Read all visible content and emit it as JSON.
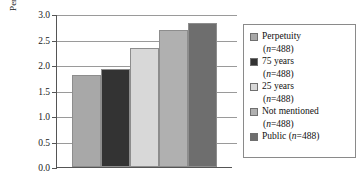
{
  "chart_data": {
    "type": "bar",
    "title": "",
    "xlabel": "",
    "ylabel": "Percent refused",
    "ylim": [
      0.0,
      3.0
    ],
    "ytick_labels": [
      "3.0",
      "2.5",
      "2.0",
      "1.5",
      "1.0",
      "0.5",
      "0.0"
    ],
    "ytick_values": [
      3.0,
      2.5,
      2.0,
      1.5,
      1.0,
      0.5,
      0.0
    ],
    "grid": true,
    "legend_position": "right",
    "categories": [
      "Perpetuity",
      "75 years",
      "25 years",
      "Not mentioned",
      "Public"
    ],
    "values": [
      1.8,
      1.92,
      2.33,
      2.68,
      2.82
    ],
    "n_per_category": [
      488,
      488,
      488,
      488,
      488
    ],
    "bar_colors": [
      "#a8a8a8",
      "#333333",
      "#d8d8d8",
      "#b0b0b0",
      "#6e6e6e"
    ],
    "series": [
      {
        "name": "Percent refused",
        "values": [
          1.8,
          1.92,
          2.33,
          2.68,
          2.82
        ]
      }
    ]
  },
  "legend": {
    "entries": [
      {
        "label": "Perpetuity",
        "sub": "(n=488)",
        "n_prefix": "n",
        "n_value": "=488",
        "color": "#a8a8a8"
      },
      {
        "label": "75 years",
        "sub": "(n=488)",
        "n_prefix": "n",
        "n_value": "=488",
        "color": "#333333"
      },
      {
        "label": "25 years",
        "sub": "(n=488)",
        "n_prefix": "n",
        "n_value": "=488",
        "color": "#d8d8d8"
      },
      {
        "label": "Not mentioned",
        "sub": "(n=488)",
        "n_prefix": "n",
        "n_value": "=488",
        "color": "#b0b0b0"
      },
      {
        "label": "Public",
        "sub": "",
        "inline_n": "(n=488)",
        "n_prefix": "n",
        "n_value": "=488",
        "color": "#6e6e6e"
      }
    ]
  }
}
